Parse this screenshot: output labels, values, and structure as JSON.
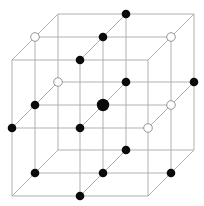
{
  "diagram": {
    "title": "",
    "type": "3x3x3 cubic lattice with site markers",
    "colors": {
      "background": "#ffffff",
      "edge": "#a8a8a8",
      "filled_marker": "#0a0a0a",
      "open_marker_stroke": "#8a8a8a"
    },
    "projection": {
      "origin": [
        12,
        60
      ],
      "spacing": 68,
      "depth_offset": [
        23,
        -23
      ]
    },
    "grid_size": 3,
    "markers": [
      {
        "i": 0,
        "j": 0,
        "d": 1,
        "type": "open"
      },
      {
        "i": 1,
        "j": 0,
        "d": 0,
        "type": "filled"
      },
      {
        "i": 1,
        "j": 0,
        "d": 1,
        "type": "filled"
      },
      {
        "i": 1,
        "j": 0,
        "d": 2,
        "type": "filled"
      },
      {
        "i": 2,
        "j": 0,
        "d": 1,
        "type": "open"
      },
      {
        "i": 0,
        "j": 1,
        "d": 0,
        "type": "filled"
      },
      {
        "i": 0,
        "j": 1,
        "d": 1,
        "type": "filled"
      },
      {
        "i": 0,
        "j": 1,
        "d": 2,
        "type": "open"
      },
      {
        "i": 1,
        "j": 1,
        "d": 0,
        "type": "filled"
      },
      {
        "i": 1,
        "j": 1,
        "d": 1,
        "type": "center"
      },
      {
        "i": 1,
        "j": 1,
        "d": 2,
        "type": "filled"
      },
      {
        "i": 2,
        "j": 1,
        "d": 0,
        "type": "open"
      },
      {
        "i": 2,
        "j": 1,
        "d": 1,
        "type": "open"
      },
      {
        "i": 2,
        "j": 1,
        "d": 2,
        "type": "filled"
      },
      {
        "i": 0,
        "j": 2,
        "d": 1,
        "type": "filled"
      },
      {
        "i": 1,
        "j": 2,
        "d": 0,
        "type": "filled"
      },
      {
        "i": 1,
        "j": 2,
        "d": 1,
        "type": "filled"
      },
      {
        "i": 1,
        "j": 2,
        "d": 2,
        "type": "filled"
      },
      {
        "i": 2,
        "j": 2,
        "d": 1,
        "type": "filled"
      }
    ],
    "marker_radius": {
      "filled": 4.3,
      "open": 4.3,
      "center": 6.2
    }
  }
}
